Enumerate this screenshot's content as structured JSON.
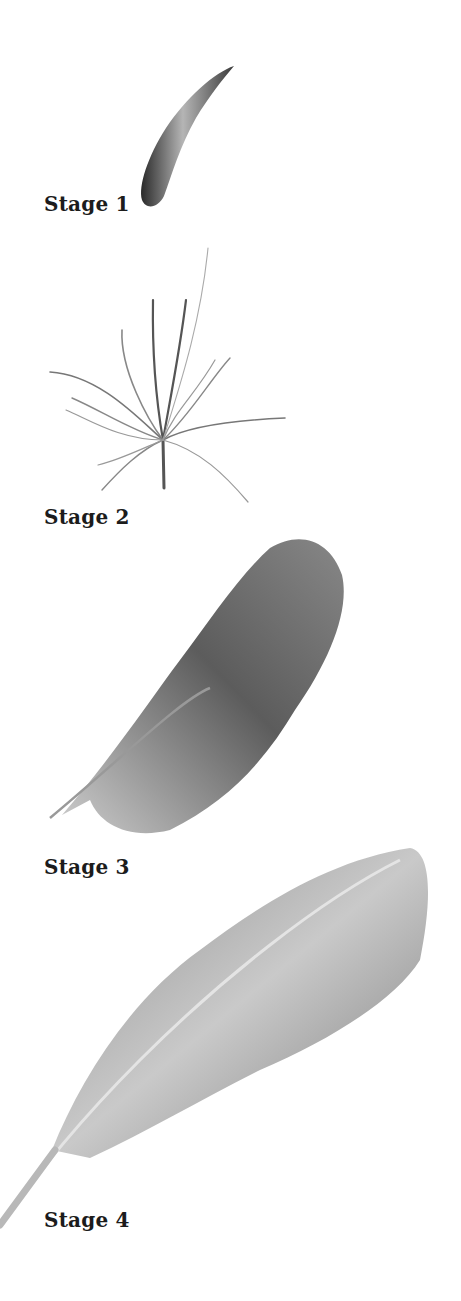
{
  "diagram": {
    "background": "#ffffff",
    "stages": [
      {
        "label": "Stage 1",
        "depiction": "curved horn-like feather bud"
      },
      {
        "label": "Stage 2",
        "depiction": "tuft of downy barbs from a short calamus"
      },
      {
        "label": "Stage 3",
        "depiction": "fluffy plumulaceous feather with rachis"
      },
      {
        "label": "Stage 4",
        "depiction": "closed pennaceous vane feather"
      }
    ]
  }
}
